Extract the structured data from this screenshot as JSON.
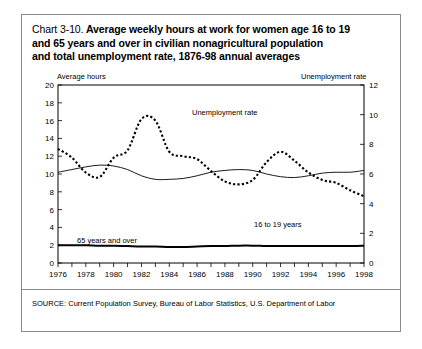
{
  "title": {
    "prefix": "Chart 3-10.",
    "line1": "Average weekly hours at work for women age 16 to 19",
    "line2": "and 65 years and over in civilian nonagricultural population",
    "line3": "and total unemployment rate, 1876-98 annual averages"
  },
  "axis_captions": {
    "left": "Average hours",
    "right": "Unemployment rate"
  },
  "source": "SOURCE: Current Population Survey, Bureau of Labor Statistics, U.S. Department of Labor",
  "annotations": {
    "unemployment": "Unemployment rate",
    "teens": "16 to 19 years",
    "elderly": "65 years and over"
  },
  "colors": {
    "ink": "#000000",
    "frame": "#8a8a8a",
    "background": "#ffffff"
  },
  "chart_data": {
    "type": "line",
    "title": "Chart 3-10. Average weekly hours at work for women age 16 to 19 and 65 years and over in civilian nonagricultural population and total unemployment rate, 1876-98 annual averages",
    "xlabel": "",
    "ylabel": "Average hours",
    "y2label": "Unemployment rate",
    "xlim": [
      1976,
      1998
    ],
    "ylim": [
      0,
      20
    ],
    "y2lim": [
      0,
      12
    ],
    "grid": false,
    "legend": "inline-annotations",
    "xticks": [
      1976,
      1978,
      1980,
      1982,
      1984,
      1986,
      1988,
      1990,
      1992,
      1994,
      1996,
      1998
    ],
    "xtick_labels": [
      "1976",
      "1978",
      "1980",
      "1982",
      "1984",
      "1986",
      "1988",
      "1990",
      "1992",
      "1994",
      "1996",
      "1998"
    ],
    "yticks": [
      0,
      2,
      4,
      6,
      8,
      10,
      12,
      14,
      16,
      18,
      20
    ],
    "ytick_labels": [
      "0",
      "2",
      "4",
      "6",
      "8",
      "10",
      "12",
      "14",
      "16",
      "18",
      "20"
    ],
    "y2ticks": [
      0,
      2,
      4,
      6,
      8,
      10,
      12
    ],
    "y2tick_labels": [
      "0",
      "2",
      "4",
      "6",
      "8",
      "10",
      "12"
    ],
    "x": [
      1976,
      1977,
      1978,
      1979,
      1980,
      1981,
      1982,
      1983,
      1984,
      1985,
      1986,
      1987,
      1988,
      1989,
      1990,
      1991,
      1992,
      1993,
      1994,
      1995,
      1996,
      1997,
      1998
    ],
    "series": [
      {
        "name": "Unemployment rate",
        "axis": "right",
        "style": "dotted",
        "units": "percent",
        "values": [
          7.7,
          7.1,
          6.1,
          5.8,
          7.1,
          7.6,
          9.7,
          9.6,
          7.5,
          7.2,
          7.0,
          6.2,
          5.5,
          5.3,
          5.6,
          6.8,
          7.5,
          6.9,
          6.1,
          5.6,
          5.4,
          4.9,
          4.5
        ]
      },
      {
        "name": "16 to 19 years",
        "axis": "left",
        "style": "thin-solid",
        "units": "hours",
        "values": [
          10.2,
          10.5,
          10.8,
          11.0,
          10.9,
          10.5,
          9.8,
          9.4,
          9.4,
          9.5,
          9.8,
          10.2,
          10.4,
          10.5,
          10.4,
          10.0,
          9.7,
          9.6,
          9.8,
          10.1,
          10.2,
          10.2,
          10.4
        ]
      },
      {
        "name": "65 years and over",
        "axis": "left",
        "style": "thick-solid",
        "units": "hours",
        "values": [
          2.0,
          2.0,
          2.0,
          1.95,
          1.95,
          1.9,
          1.85,
          1.85,
          1.8,
          1.8,
          1.85,
          1.9,
          1.9,
          1.95,
          1.95,
          1.9,
          1.9,
          1.9,
          1.9,
          1.9,
          1.9,
          1.9,
          1.95
        ]
      }
    ]
  }
}
